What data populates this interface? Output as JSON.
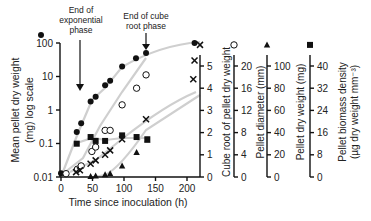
{
  "chart_data": {
    "type": "scatter",
    "title": "",
    "xlabel": "Time since inoculation (h)",
    "xlim": [
      0,
      220
    ],
    "x_ticks": [
      0,
      50,
      100,
      150,
      200
    ],
    "annotations": [
      {
        "text": [
          "End of",
          "exponential",
          "phase"
        ],
        "x": 37
      },
      {
        "text": [
          "End of cube",
          "root phase"
        ],
        "x": 135
      }
    ],
    "axes": [
      {
        "id": "log_weight",
        "label": [
          "Mean pellet dry weight",
          "(mg) log scale"
        ],
        "scale": "log",
        "ticks": [
          0.01,
          0.1,
          1,
          10,
          100
        ],
        "tick_labels": [
          "0.01",
          "0.1",
          "1",
          "10",
          "100"
        ],
        "range": [
          0.01,
          100
        ],
        "side": "left",
        "marker": "filled-circle"
      },
      {
        "id": "cube_root",
        "label": [
          "Cube root of pellet dry weight"
        ],
        "scale": "linear",
        "ticks": [
          0,
          1,
          2,
          3,
          4,
          5
        ],
        "tick_labels": [
          "0",
          "1",
          "2",
          "3",
          "4",
          "5"
        ],
        "range": [
          0,
          5.5
        ],
        "side": "right",
        "marker": "cross"
      },
      {
        "id": "diameter",
        "label": [
          "Pellet diameter (mm)"
        ],
        "scale": "linear",
        "ticks": [
          0,
          4,
          8,
          12,
          16,
          20
        ],
        "tick_labels": [
          "0",
          "4",
          "8",
          "12",
          "16",
          "20"
        ],
        "range": [
          0,
          22
        ],
        "side": "right",
        "marker": "open-circle"
      },
      {
        "id": "dry_weight",
        "label": [
          "Pellet dry weight (mg)"
        ],
        "scale": "linear",
        "ticks": [
          0,
          20,
          40,
          60,
          80,
          100
        ],
        "tick_labels": [
          "0",
          "20",
          "40",
          "60",
          "80",
          "100"
        ],
        "range": [
          0,
          110
        ],
        "side": "right",
        "marker": "filled-triangle"
      },
      {
        "id": "density",
        "label": [
          "Pellet biomass density",
          "(µg dry weight mm⁻³)"
        ],
        "scale": "linear",
        "ticks": [
          0,
          8,
          16,
          24,
          32,
          40
        ],
        "tick_labels": [
          "0",
          "8",
          "16",
          "24",
          "32",
          "40"
        ],
        "range": [
          0,
          44
        ],
        "side": "right",
        "marker": "filled-square"
      }
    ],
    "series": [
      {
        "name": "Mean pellet dry weight (log)",
        "axis": "log_weight",
        "marker": "filled-circle",
        "x": [
          0,
          25,
          32,
          47,
          55,
          70,
          78,
          97,
          119,
          135,
          212
        ],
        "y": [
          0.013,
          0.22,
          0.4,
          1.8,
          2.5,
          5.5,
          7.5,
          20,
          35,
          50,
          100
        ]
      },
      {
        "name": "Pellet diameter",
        "axis": "diameter",
        "marker": "open-circle",
        "x": [
          8,
          26,
          32,
          49,
          55,
          70,
          78,
          97,
          120,
          135
        ],
        "y": [
          0.6,
          1.4,
          2.0,
          4.6,
          5.4,
          8.4,
          8.4,
          13.0,
          16.0,
          18.4
        ]
      },
      {
        "name": "Cube root of pellet dry weight",
        "axis": "cube_root",
        "marker": "cross",
        "x": [
          24,
          30,
          47,
          55,
          70,
          78,
          97,
          135,
          210,
          212
        ],
        "y": [
          0.22,
          0.3,
          0.6,
          0.75,
          1.0,
          1.2,
          1.7,
          2.6,
          4.4,
          5.25
        ]
      },
      {
        "name": "Pellet dry weight",
        "axis": "dry_weight",
        "marker": "filled-triangle",
        "x": [
          47,
          55,
          70,
          78,
          97,
          120,
          137
        ],
        "y": [
          0.5,
          1.0,
          2.0,
          3.0,
          10.0,
          22.0,
          33.0
        ]
      },
      {
        "name": "Pellet biomass density",
        "axis": "density",
        "marker": "filled-square",
        "x": [
          25,
          47,
          55,
          70,
          97,
          120,
          137
        ],
        "y": [
          12.0,
          14.4,
          13.0,
          13.0,
          15.0,
          14.4,
          13.6
        ]
      }
    ]
  }
}
